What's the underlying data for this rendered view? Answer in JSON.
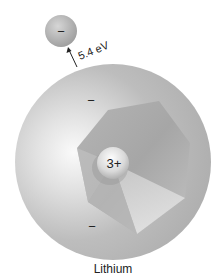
{
  "diagram": {
    "element_label": "Lithium",
    "nucleus_charge": "3+",
    "ionization_energy": "5.4 eV",
    "electron_symbol": "−",
    "inner_electrons": [
      "−",
      "−"
    ],
    "colors": {
      "background": "#ffffff",
      "atom_sphere": "#b4b4b4",
      "atom_highlight": "#f4f4f4",
      "inner_shell": "#a9a9a9",
      "nucleus": "#d8d8d8",
      "text": "#222222"
    }
  }
}
